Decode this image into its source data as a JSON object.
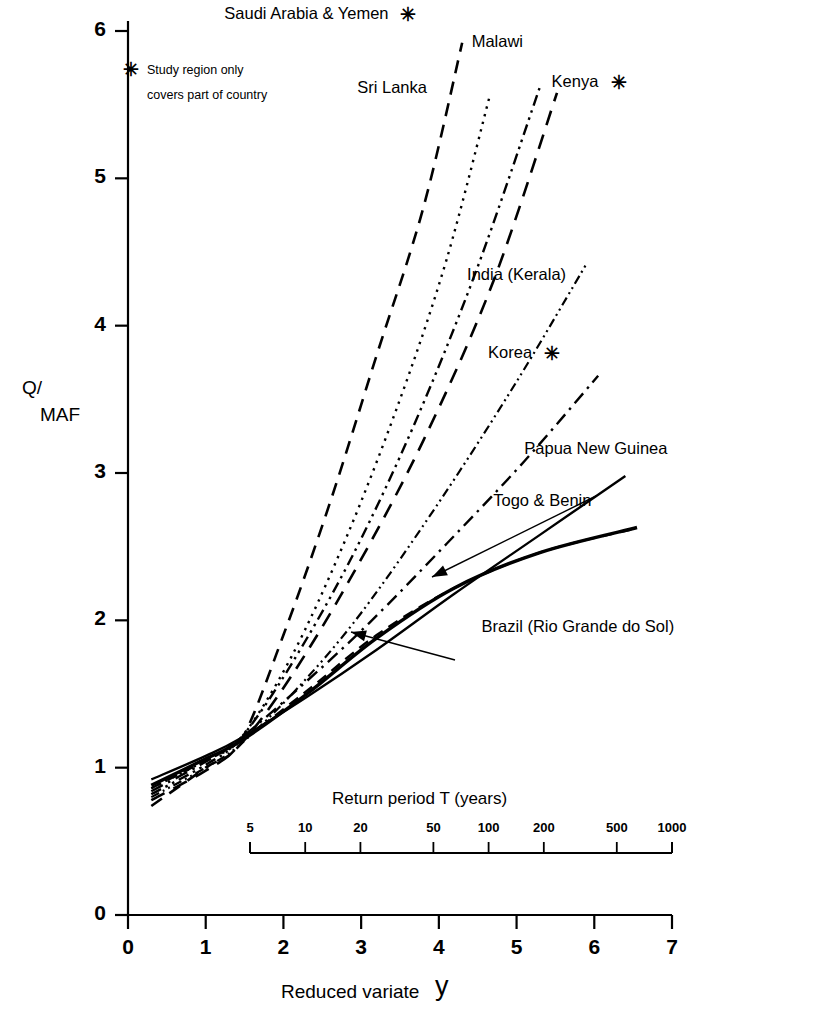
{
  "figure": {
    "axes": {
      "y_title_line1": "Q/",
      "y_title_line2": "MAF",
      "y_ticks": [
        "0",
        "1",
        "2",
        "3",
        "4",
        "5",
        "6"
      ],
      "y_values": [
        0,
        1,
        2,
        3,
        4,
        5,
        6
      ],
      "x_title": "Reduced variate",
      "x_title_symbol": "y",
      "x_ticks": [
        "0",
        "1",
        "2",
        "3",
        "4",
        "5",
        "6",
        "7"
      ],
      "x_values": [
        0,
        1,
        2,
        3,
        4,
        5,
        6,
        7
      ],
      "x_origin_label": "0"
    },
    "return_period_axis": {
      "title": "Return period T (years)",
      "ticks": [
        "5",
        "10",
        "20",
        "50",
        "100",
        "200",
        "500",
        "1000"
      ],
      "tick_values": [
        5,
        10,
        20,
        50,
        100,
        200,
        500,
        1000
      ]
    },
    "note": {
      "marker": "✳",
      "line1": "Study region only",
      "line2": "covers part of country"
    }
  },
  "chart_data": {
    "type": "line",
    "title": "",
    "xlabel": "Reduced variate y",
    "ylabel": "Q/MAF",
    "xlim": [
      0,
      7
    ],
    "ylim": [
      0,
      6
    ],
    "grid": false,
    "legend": "inline-annotations",
    "secondary_x_axis": {
      "label": "Return period T (years)",
      "ticks": [
        5,
        10,
        20,
        50,
        100,
        200,
        500,
        1000
      ]
    },
    "series": [
      {
        "name": "Saudi Arabia & Yemen",
        "style": "dashed",
        "starred": true,
        "label_x": 3.35,
        "label_y": 6.12,
        "points": [
          [
            0.3,
            0.74
          ],
          [
            1.0,
            1.0
          ],
          [
            1.45,
            1.18
          ],
          [
            2.0,
            1.9
          ],
          [
            2.6,
            2.8
          ],
          [
            3.2,
            3.8
          ],
          [
            3.8,
            4.8
          ],
          [
            4.3,
            5.92
          ]
        ]
      },
      {
        "name": "Sri Lanka",
        "style": "dotted",
        "starred": false,
        "label_x": 3.4,
        "label_y": 5.62,
        "points": [
          [
            0.3,
            0.86
          ],
          [
            1.0,
            1.05
          ],
          [
            1.45,
            1.2
          ],
          [
            2.1,
            1.75
          ],
          [
            2.8,
            2.55
          ],
          [
            3.5,
            3.5
          ],
          [
            4.1,
            4.45
          ],
          [
            4.65,
            5.55
          ]
        ]
      },
      {
        "name": "Malawi",
        "style": "dashdotdot",
        "starred": false,
        "label_x": 4.75,
        "label_y": 5.93,
        "points": [
          [
            0.3,
            0.82
          ],
          [
            1.0,
            1.02
          ],
          [
            1.45,
            1.2
          ],
          [
            2.1,
            1.7
          ],
          [
            2.9,
            2.45
          ],
          [
            3.7,
            3.35
          ],
          [
            4.5,
            4.4
          ],
          [
            5.3,
            5.62
          ]
        ]
      },
      {
        "name": "Kenya",
        "style": "dashed-long",
        "starred": true,
        "label_x": 5.45,
        "label_y": 5.66,
        "points": [
          [
            0.3,
            0.78
          ],
          [
            1.0,
            0.98
          ],
          [
            1.45,
            1.16
          ],
          [
            2.1,
            1.62
          ],
          [
            2.9,
            2.32
          ],
          [
            3.8,
            3.22
          ],
          [
            4.7,
            4.3
          ],
          [
            5.52,
            5.58
          ]
        ]
      },
      {
        "name": "India (Kerala)",
        "style": "dashdotdot-fine",
        "starred": false,
        "label_x": 5.0,
        "label_y": 4.35,
        "points": [
          [
            0.3,
            0.8
          ],
          [
            1.0,
            1.0
          ],
          [
            1.45,
            1.16
          ],
          [
            2.2,
            1.55
          ],
          [
            3.0,
            2.05
          ],
          [
            4.0,
            2.8
          ],
          [
            5.0,
            3.62
          ],
          [
            5.9,
            4.42
          ]
        ]
      },
      {
        "name": "Korea",
        "style": "dashdot",
        "starred": true,
        "label_x": 5.2,
        "label_y": 3.82,
        "points": [
          [
            0.3,
            0.84
          ],
          [
            1.0,
            1.04
          ],
          [
            1.45,
            1.2
          ],
          [
            2.2,
            1.54
          ],
          [
            3.1,
            1.98
          ],
          [
            4.1,
            2.52
          ],
          [
            5.1,
            3.08
          ],
          [
            6.05,
            3.66
          ]
        ]
      },
      {
        "name": "Papua New Guinea",
        "style": "solid",
        "starred": false,
        "label_x": 5.1,
        "label_y": 3.17,
        "points": [
          [
            0.3,
            0.92
          ],
          [
            1.0,
            1.08
          ],
          [
            1.45,
            1.2
          ],
          [
            2.3,
            1.48
          ],
          [
            3.2,
            1.8
          ],
          [
            4.2,
            2.18
          ],
          [
            5.3,
            2.58
          ],
          [
            6.4,
            2.98
          ]
        ]
      },
      {
        "name": "Togo & Benin",
        "style": "dashed-medium",
        "starred": false,
        "label_x": 4.7,
        "label_y": 2.82,
        "points": [
          [
            0.3,
            0.86
          ],
          [
            1.0,
            1.05
          ],
          [
            1.45,
            1.18
          ],
          [
            2.3,
            1.52
          ],
          [
            3.2,
            1.9
          ],
          [
            4.2,
            2.22
          ],
          [
            5.3,
            2.46
          ],
          [
            6.5,
            2.62
          ]
        ]
      },
      {
        "name": "Brazil (Rio Grande do Sol)",
        "style": "solid-thick",
        "starred": false,
        "label_x": 4.55,
        "label_y": 1.96,
        "points": [
          [
            0.3,
            0.88
          ],
          [
            1.0,
            1.06
          ],
          [
            1.45,
            1.18
          ],
          [
            2.3,
            1.5
          ],
          [
            3.2,
            1.88
          ],
          [
            4.2,
            2.22
          ],
          [
            5.3,
            2.46
          ],
          [
            6.55,
            2.63
          ]
        ]
      }
    ]
  }
}
